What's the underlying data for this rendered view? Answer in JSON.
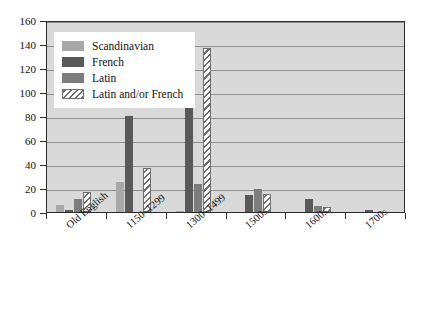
{
  "chart_data": {
    "type": "bar",
    "title": "",
    "xlabel": "",
    "ylabel": "",
    "ylim": [
      0,
      160
    ],
    "ytick_step": 20,
    "grid": true,
    "legend_position": "top-left-inside",
    "categories": [
      "Old English",
      "1150–1299",
      "1300–1499",
      "1500s",
      "1600s",
      "1700s"
    ],
    "series": [
      {
        "name": "Scandinavian",
        "color": "#a8a8a8",
        "values": [
          6,
          25,
          1,
          0,
          0,
          0
        ]
      },
      {
        "name": "French",
        "color": "#595959",
        "values": [
          1.5,
          80,
          108,
          14,
          11,
          1.5
        ]
      },
      {
        "name": "Latin",
        "color": "#7d7d7d",
        "values": [
          11,
          0,
          23,
          19.5,
          5,
          0
        ]
      },
      {
        "name": "Latin and/or French",
        "color": "#6f6f6f",
        "hatched": true,
        "values": [
          17,
          37,
          137,
          15,
          4,
          0
        ]
      }
    ],
    "ytick_labels": [
      "0",
      "20",
      "40",
      "60",
      "80",
      "100",
      "120",
      "140",
      "160"
    ]
  },
  "legend": {
    "items": [
      {
        "label": "Scandinavian"
      },
      {
        "label": "French"
      },
      {
        "label": "Latin"
      },
      {
        "label": "Latin and/or French"
      }
    ]
  }
}
